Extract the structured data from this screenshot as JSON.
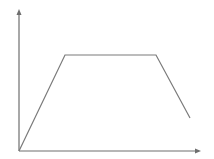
{
  "chart_data": {
    "type": "line",
    "title": "",
    "xlabel": "",
    "ylabel": "",
    "grid": false,
    "legend": null,
    "axes": {
      "x_arrow": true,
      "y_arrow": true,
      "ticks": false
    },
    "series": [
      {
        "name": "profile",
        "points": [
          {
            "x": 0,
            "y": 0
          },
          {
            "x": 0.25,
            "y": 0.68
          },
          {
            "x": 0.765,
            "y": 0.68
          },
          {
            "x": 0.955,
            "y": 0.23
          }
        ],
        "pixel_points": [
          [
            19,
            151
          ],
          [
            65,
            55
          ],
          [
            156,
            55
          ],
          [
            190,
            118
          ]
        ]
      }
    ],
    "xlim": [
      0,
      1
    ],
    "ylim": [
      0,
      1
    ]
  },
  "colors": {
    "line": "#7a7a7a",
    "axis": "#6e6e6e",
    "background": "#ffffff"
  },
  "geometry": {
    "origin": [
      19,
      151
    ],
    "x_axis_end": [
      201,
      151
    ],
    "y_axis_end": [
      19,
      9
    ]
  }
}
